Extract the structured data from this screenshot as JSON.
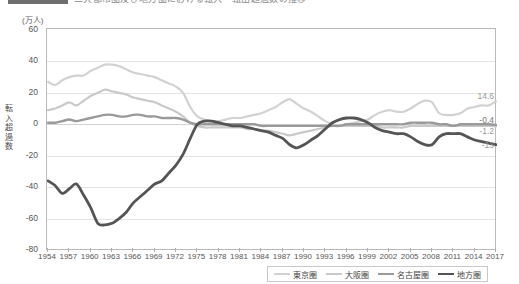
{
  "title": {
    "badge_label": "図表",
    "text": "三大都市圏及び地方圏における転入・転出超過数の推移"
  },
  "axis": {
    "unit_label": "(万人)",
    "vertical_title": "転入超過数",
    "yticks": [
      60,
      40,
      20,
      0,
      -20,
      -40,
      -60,
      -80
    ],
    "ylim": [
      -80,
      60
    ],
    "xticks": [
      1954,
      1957,
      1960,
      1963,
      1966,
      1969,
      1972,
      1975,
      1978,
      1981,
      1984,
      1987,
      1990,
      1993,
      1996,
      1999,
      2002,
      2005,
      2008,
      2011,
      2014,
      2017
    ]
  },
  "legend": {
    "position": "bottom",
    "items": [
      {
        "label": "東京圏",
        "color": "#d2d2d2",
        "width": 2.2
      },
      {
        "label": "大阪圏",
        "color": "#c9c9c9",
        "width": 2.2
      },
      {
        "label": "名古屋圏",
        "color": "#9a9a9a",
        "width": 2.4
      },
      {
        "label": "地方圏",
        "color": "#555555",
        "width": 2.8
      }
    ]
  },
  "end_labels": [
    {
      "name": "tokyo-end-label",
      "text": "14.6",
      "value": 14.6,
      "color": "#9a9a9a"
    },
    {
      "name": "nagoya-end-label",
      "text": "-0.4",
      "value": -0.4,
      "color": "#777777"
    },
    {
      "name": "osaka-end-label",
      "text": "-1.2",
      "value": -1.2,
      "color": "#9a9a9a"
    },
    {
      "name": "regional-end-label",
      "text": "-13",
      "value": -13,
      "color": "#9a9a9a"
    }
  ],
  "chart_data": {
    "type": "line",
    "title": "三大都市圏及び地方圏における転入・転出超過数の推移",
    "xlabel": "",
    "ylabel": "転入超過数",
    "unit": "万人",
    "ylim": [
      -80,
      60
    ],
    "xlim": [
      1954,
      2017
    ],
    "grid": true,
    "legend_position": "bottom",
    "x": [
      1954,
      1955,
      1956,
      1957,
      1958,
      1959,
      1960,
      1961,
      1962,
      1963,
      1964,
      1965,
      1966,
      1967,
      1968,
      1969,
      1970,
      1971,
      1972,
      1973,
      1974,
      1975,
      1976,
      1977,
      1978,
      1979,
      1980,
      1981,
      1982,
      1983,
      1984,
      1985,
      1986,
      1987,
      1988,
      1989,
      1990,
      1991,
      1992,
      1993,
      1994,
      1995,
      1996,
      1997,
      1998,
      1999,
      2000,
      2001,
      2002,
      2003,
      2004,
      2005,
      2006,
      2007,
      2008,
      2009,
      2010,
      2011,
      2012,
      2013,
      2014,
      2015,
      2016,
      2017
    ],
    "series": [
      {
        "name": "東京圏",
        "color": "#d2d2d2",
        "values": [
          27,
          25,
          28,
          30,
          31,
          31,
          34,
          36,
          38,
          38,
          37,
          35,
          33,
          32,
          31,
          30,
          28,
          26,
          24,
          20,
          11,
          5,
          3,
          2,
          2,
          3,
          4,
          4,
          5,
          6,
          7,
          9,
          11,
          14,
          16,
          13,
          10,
          8,
          5,
          2,
          0,
          -1,
          0,
          1,
          2,
          3,
          6,
          8,
          9,
          8,
          8,
          10,
          13,
          15,
          14,
          7,
          6,
          6,
          7,
          10,
          11,
          12,
          12,
          14.6
        ]
      },
      {
        "name": "大阪圏",
        "color": "#c9c9c9",
        "values": [
          9,
          10,
          12,
          14,
          12,
          15,
          18,
          20,
          22,
          21,
          20,
          19,
          17,
          16,
          15,
          14,
          12,
          10,
          8,
          5,
          1,
          -1,
          -2,
          -2,
          -2,
          -2,
          -2,
          -2,
          -3,
          -3,
          -4,
          -4,
          -5,
          -6,
          -7,
          -6,
          -5,
          -4,
          -3,
          -2,
          -1,
          -1,
          -1,
          -1,
          -1,
          -1,
          -1,
          -2,
          -2,
          -2,
          -2,
          -1,
          -1,
          -1,
          -1,
          -1,
          -1,
          -1,
          -1,
          -1,
          -1,
          -1,
          -1,
          -1.2
        ]
      },
      {
        "name": "名古屋圏",
        "color": "#9a9a9a",
        "values": [
          1,
          1,
          2,
          3,
          2,
          3,
          4,
          5,
          6,
          6,
          5,
          5,
          6,
          6,
          5,
          5,
          4,
          4,
          4,
          3,
          1,
          0,
          0,
          0,
          0,
          0,
          0,
          0,
          0,
          0,
          -1,
          -1,
          -1,
          -1,
          -1,
          -1,
          -1,
          -1,
          -1,
          -1,
          -1,
          -1,
          0,
          0,
          0,
          0,
          0,
          0,
          0,
          0,
          0,
          1,
          1,
          1,
          1,
          0,
          0,
          -1,
          0,
          0,
          0,
          0,
          0,
          -0.4
        ]
      },
      {
        "name": "地方圏",
        "color": "#555555",
        "values": [
          -36,
          -39,
          -44,
          -41,
          -38,
          -45,
          -53,
          -63,
          -64,
          -63,
          -60,
          -56,
          -50,
          -46,
          -42,
          -38,
          -36,
          -31,
          -26,
          -19,
          -9,
          0,
          2,
          2,
          1,
          0,
          -1,
          -1,
          -2,
          -3,
          -4,
          -5,
          -7,
          -9,
          -13,
          -15,
          -13,
          -10,
          -7,
          -3,
          1,
          3,
          4,
          4,
          3,
          1,
          -2,
          -4,
          -5,
          -6,
          -6,
          -8,
          -11,
          -13,
          -13,
          -8,
          -6,
          -6,
          -6,
          -8,
          -10,
          -11,
          -12,
          -13
        ]
      }
    ]
  }
}
